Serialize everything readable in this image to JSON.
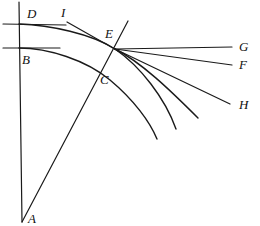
{
  "figure": {
    "width": 260,
    "height": 226,
    "background": "#ffffff",
    "stroke_color": "#1a1a1a"
  },
  "labels": {
    "A": "A",
    "B": "B",
    "C": "C",
    "D": "D",
    "E": "E",
    "F": "F",
    "G": "G",
    "H": "H",
    "I": "I"
  },
  "chart_data": {
    "type": "diagram",
    "xlabel": "",
    "ylabel": "",
    "xlim": [
      0,
      260
    ],
    "ylim": [
      226,
      0
    ],
    "grid": false,
    "legend": "none",
    "points": [
      {
        "name": "A",
        "x": 22,
        "y": 222,
        "label": "A",
        "label_x": 28,
        "label_y": 212
      },
      {
        "name": "B",
        "x": 19,
        "y": 48,
        "label": "B",
        "label_x": 22,
        "label_y": 53
      },
      {
        "name": "C",
        "x": 105,
        "y": 78,
        "label": "C",
        "label_x": 100,
        "label_y": 73
      },
      {
        "name": "D",
        "x": 19,
        "y": 24,
        "label": "D",
        "label_x": 27,
        "label_y": 7
      },
      {
        "name": "E",
        "x": 115,
        "y": 49,
        "label": "E",
        "label_x": 105,
        "label_y": 27
      },
      {
        "name": "F",
        "x": 232,
        "y": 65,
        "label": "F",
        "label_x": 239,
        "label_y": 58
      },
      {
        "name": "G",
        "x": 232,
        "y": 47,
        "label": "G",
        "label_x": 239,
        "label_y": 40
      },
      {
        "name": "H",
        "x": 232,
        "y": 105,
        "label": "H",
        "label_x": 239,
        "label_y": 98
      },
      {
        "name": "I",
        "x": 67,
        "y": 20,
        "label": "I",
        "label_x": 61,
        "label_y": 6
      }
    ],
    "segments": [
      {
        "name": "vertical-axis",
        "x1": 19,
        "y1": 2,
        "x2": 22,
        "y2": 222
      },
      {
        "name": "horizontal-line-D",
        "x1": 3,
        "y1": 24,
        "x2": 66,
        "y2": 25
      },
      {
        "name": "horizontal-line-B",
        "x1": 3,
        "y1": 48,
        "x2": 60,
        "y2": 48
      },
      {
        "name": "line-A-through-E",
        "x1": 22,
        "y1": 222,
        "x2": 128,
        "y2": 21
      },
      {
        "name": "ray-E-to-G",
        "x1": 115,
        "y1": 49,
        "x2": 232,
        "y2": 47
      },
      {
        "name": "ray-E-to-F",
        "x1": 115,
        "y1": 49,
        "x2": 232,
        "y2": 65
      },
      {
        "name": "ray-E-to-H",
        "x1": 115,
        "y1": 49,
        "x2": 230,
        "y2": 104
      },
      {
        "name": "tangent-I-to-E",
        "x1": 67,
        "y1": 22,
        "x2": 120,
        "y2": 52
      }
    ],
    "curves": [
      {
        "name": "curve-D-to-E-extended",
        "description": "upper arc starting at D, passing through E, descending to lower right",
        "path": "M 19 24 C 50 25, 92 34, 115 49 C 140 66, 165 98, 176 129"
      },
      {
        "name": "curve-B-through-C",
        "description": "lower arc starting at B, passing near C, descending to lower right",
        "path": "M 19 48 C 48 48, 86 60, 110 80 C 134 100, 150 122, 157 139"
      },
      {
        "name": "curve-E-descending",
        "description": "arc from E curving down and right to interior endpoint",
        "path": "M 115 49 C 141 62, 170 90, 198 118"
      }
    ]
  }
}
